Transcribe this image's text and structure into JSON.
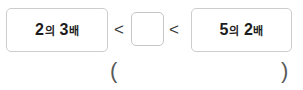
{
  "worksheet": {
    "type": "math-inequality-fill-in-the-blank",
    "language": "ko"
  },
  "inequality": {
    "left_expression": {
      "number": "2",
      "particle": "의",
      "multiplier": "3",
      "unit": "배",
      "full_text": "2의 3배"
    },
    "relation_left": "<",
    "answer_box": {
      "value": "",
      "placeholder": ""
    },
    "relation_right": "<",
    "right_expression": {
      "number": "5",
      "particle": "의",
      "multiplier": "2",
      "unit": "배",
      "full_text": "5의 2배"
    }
  },
  "answer_field": {
    "open_paren": "(",
    "close_paren": ")",
    "value": ""
  },
  "colors": {
    "box_border": "#cdcdcd",
    "answer_box_border": "#c6c6c6",
    "text": "#1d1d1d",
    "sign": "#3a3a3a",
    "paren": "#5a5a5a",
    "background": "#ffffff"
  }
}
